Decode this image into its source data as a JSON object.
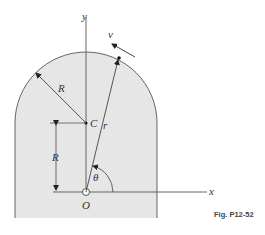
{
  "figure": {
    "caption": "Fig. P12-52",
    "labels": {
      "y_axis": "y",
      "x_axis": "x",
      "origin": "O",
      "center": "C",
      "radius_label": "R",
      "height_label": "R",
      "position_vector": "r",
      "velocity": "v",
      "angle": "θ"
    },
    "colors": {
      "region_fill": "#e6e6e6",
      "line": "#555555",
      "background": "#ffffff"
    }
  }
}
